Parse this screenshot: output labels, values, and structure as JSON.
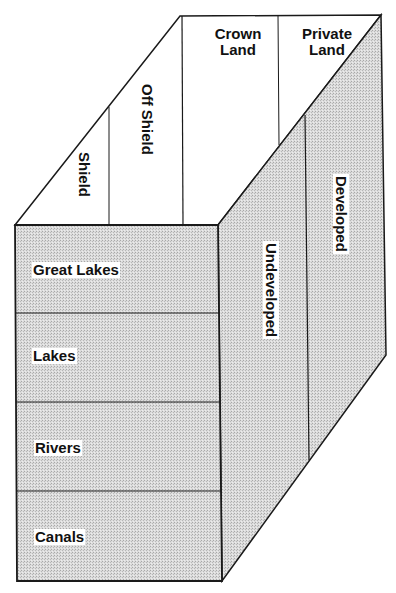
{
  "diagram": {
    "type": "3d-box-classification",
    "colors": {
      "outline": "#1a1a1a",
      "shaded_face": "#d4d4d4",
      "top_face": "#ffffff",
      "background": "#ffffff"
    },
    "top_face": {
      "divisions": [
        {
          "label": "Shield"
        },
        {
          "label": "Off  Shield"
        },
        {
          "label_line1": "Crown",
          "label_line2": "Land"
        },
        {
          "label_line1": "Private",
          "label_line2": "Land"
        }
      ]
    },
    "front_face": {
      "rows": [
        {
          "label": "Great  Lakes"
        },
        {
          "label": "Lakes"
        },
        {
          "label": "Rivers"
        },
        {
          "label": "Canals"
        }
      ]
    },
    "side_face": {
      "columns": [
        {
          "label": "Undeveloped"
        },
        {
          "label": "Developed"
        }
      ]
    }
  }
}
